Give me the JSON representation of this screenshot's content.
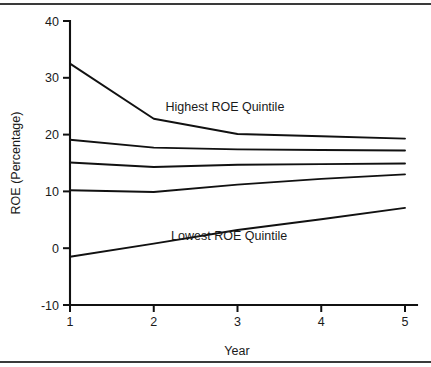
{
  "figure": {
    "border_color": "#3a3a3a",
    "background": "#ffffff",
    "line_color": "#111111"
  },
  "chart_data": {
    "type": "line",
    "title": "",
    "xlabel": "Year",
    "ylabel": "ROE (Percentage)",
    "x": [
      1,
      2,
      3,
      4,
      5
    ],
    "xlim": [
      1,
      5
    ],
    "ylim": [
      -10,
      40
    ],
    "xticks": [
      "1",
      "2",
      "3",
      "4",
      "5"
    ],
    "yticks": [
      "-10",
      "0",
      "10",
      "20",
      "30",
      "40"
    ],
    "ytick_values": [
      -10,
      0,
      10,
      20,
      30,
      40
    ],
    "grid": false,
    "legend": "none",
    "series": [
      {
        "name": "Highest ROE Quintile",
        "values": [
          32.5,
          22.8,
          20.1,
          19.7,
          19.3
        ]
      },
      {
        "name": "Second ROE Quintile",
        "values": [
          19.1,
          17.7,
          17.4,
          17.3,
          17.2
        ]
      },
      {
        "name": "Third ROE Quintile",
        "values": [
          15.1,
          14.3,
          14.7,
          14.8,
          14.9
        ]
      },
      {
        "name": "Fourth ROE Quintile",
        "values": [
          10.2,
          9.9,
          11.2,
          12.2,
          13.0
        ]
      },
      {
        "name": "Lowest ROE Quintile",
        "values": [
          -1.5,
          0.8,
          3.2,
          5.1,
          7.1
        ]
      }
    ],
    "annotations": [
      {
        "text": "Highest ROE Quintile",
        "x": 2.85,
        "y": 24.2
      },
      {
        "text": "Lowest ROE Quintile",
        "x": 2.9,
        "y": 1.5
      }
    ]
  }
}
